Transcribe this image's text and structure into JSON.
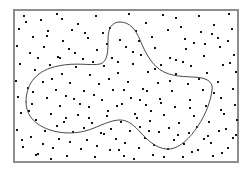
{
  "figure": {
    "title": "",
    "caption": "",
    "background_color": "#ffffff"
  },
  "chart_data": {
    "type": "scatter",
    "title": "",
    "subtitle": "",
    "xlabel": "",
    "ylabel": "",
    "legend": [],
    "legend_position": "none",
    "grid": false,
    "axis_ticks": false,
    "tick_labels": [],
    "annotations": [],
    "xlim": [
      0,
      251
    ],
    "ylim": [
      171,
      0
    ],
    "frame": {
      "name": "plot-frame",
      "x": 14,
      "y": 10,
      "width": 224,
      "height": 152,
      "stroke_color": "#8d8d8d",
      "fill_color": "#ffffff",
      "stroke_width": 1.1
    },
    "point_style": {
      "marker": "square",
      "size": 2.1,
      "color": "#151515"
    },
    "point_count": 206,
    "points": [
      [
        24,
        16
      ],
      [
        41,
        20
      ],
      [
        57,
        14
      ],
      [
        78,
        24
      ],
      [
        96,
        16
      ],
      [
        110,
        28
      ],
      [
        129,
        14
      ],
      [
        146,
        23
      ],
      [
        163,
        15
      ],
      [
        181,
        27
      ],
      [
        199,
        16
      ],
      [
        214,
        25
      ],
      [
        229,
        14
      ],
      [
        19,
        29
      ],
      [
        33,
        37
      ],
      [
        48,
        31
      ],
      [
        63,
        41
      ],
      [
        72,
        30
      ],
      [
        88,
        38
      ],
      [
        103,
        33
      ],
      [
        120,
        40
      ],
      [
        136,
        31
      ],
      [
        152,
        37
      ],
      [
        168,
        30
      ],
      [
        185,
        39
      ],
      [
        201,
        32
      ],
      [
        218,
        38
      ],
      [
        232,
        29
      ],
      [
        17,
        46
      ],
      [
        30,
        53
      ],
      [
        44,
        47
      ],
      [
        58,
        57
      ],
      [
        69,
        49
      ],
      [
        83,
        59
      ],
      [
        97,
        50
      ],
      [
        112,
        58
      ],
      [
        126,
        47
      ],
      [
        141,
        55
      ],
      [
        155,
        48
      ],
      [
        170,
        58
      ],
      [
        186,
        49
      ],
      [
        204,
        56
      ],
      [
        220,
        47
      ],
      [
        234,
        55
      ],
      [
        20,
        64
      ],
      [
        35,
        70
      ],
      [
        50,
        65
      ],
      [
        62,
        74
      ],
      [
        76,
        67
      ],
      [
        90,
        75
      ],
      [
        104,
        66
      ],
      [
        118,
        73
      ],
      [
        133,
        64
      ],
      [
        148,
        72
      ],
      [
        161,
        65
      ],
      [
        176,
        74
      ],
      [
        191,
        66
      ],
      [
        207,
        73
      ],
      [
        223,
        65
      ],
      [
        236,
        72
      ],
      [
        16,
        81
      ],
      [
        28,
        88
      ],
      [
        43,
        82
      ],
      [
        56,
        90
      ],
      [
        70,
        83
      ],
      [
        84,
        91
      ],
      [
        99,
        84
      ],
      [
        113,
        90
      ],
      [
        128,
        82
      ],
      [
        143,
        89
      ],
      [
        158,
        83
      ],
      [
        172,
        91
      ],
      [
        188,
        84
      ],
      [
        203,
        90
      ],
      [
        218,
        82
      ],
      [
        233,
        89
      ],
      [
        18,
        97
      ],
      [
        32,
        104
      ],
      [
        47,
        98
      ],
      [
        60,
        106
      ],
      [
        74,
        99
      ],
      [
        89,
        107
      ],
      [
        102,
        100
      ],
      [
        117,
        106
      ],
      [
        131,
        98
      ],
      [
        146,
        105
      ],
      [
        160,
        99
      ],
      [
        175,
        107
      ],
      [
        190,
        100
      ],
      [
        206,
        106
      ],
      [
        221,
        98
      ],
      [
        235,
        105
      ],
      [
        21,
        113
      ],
      [
        36,
        120
      ],
      [
        51,
        114
      ],
      [
        64,
        122
      ],
      [
        78,
        115
      ],
      [
        92,
        123
      ],
      [
        107,
        116
      ],
      [
        121,
        122
      ],
      [
        135,
        114
      ],
      [
        150,
        121
      ],
      [
        164,
        115
      ],
      [
        179,
        123
      ],
      [
        194,
        116
      ],
      [
        209,
        122
      ],
      [
        224,
        114
      ],
      [
        237,
        120
      ],
      [
        17,
        130
      ],
      [
        31,
        137
      ],
      [
        45,
        131
      ],
      [
        59,
        139
      ],
      [
        73,
        132
      ],
      [
        87,
        140
      ],
      [
        101,
        133
      ],
      [
        116,
        139
      ],
      [
        130,
        131
      ],
      [
        145,
        138
      ],
      [
        159,
        132
      ],
      [
        174,
        140
      ],
      [
        189,
        133
      ],
      [
        204,
        139
      ],
      [
        219,
        131
      ],
      [
        233,
        138
      ],
      [
        23,
        147
      ],
      [
        38,
        154
      ],
      [
        53,
        148
      ],
      [
        67,
        156
      ],
      [
        81,
        149
      ],
      [
        95,
        157
      ],
      [
        110,
        150
      ],
      [
        124,
        156
      ],
      [
        139,
        148
      ],
      [
        153,
        155
      ],
      [
        168,
        149
      ],
      [
        183,
        157
      ],
      [
        198,
        150
      ],
      [
        213,
        156
      ],
      [
        228,
        148
      ],
      [
        26,
        22
      ],
      [
        62,
        19
      ],
      [
        85,
        33
      ],
      [
        107,
        44
      ],
      [
        139,
        41
      ],
      [
        176,
        18
      ],
      [
        194,
        43
      ],
      [
        212,
        34
      ],
      [
        228,
        41
      ],
      [
        38,
        58
      ],
      [
        52,
        79
      ],
      [
        66,
        96
      ],
      [
        93,
        62
      ],
      [
        109,
        79
      ],
      [
        124,
        90
      ],
      [
        140,
        100
      ],
      [
        155,
        69
      ],
      [
        170,
        81
      ],
      [
        183,
        62
      ],
      [
        199,
        79
      ],
      [
        214,
        93
      ],
      [
        230,
        63
      ],
      [
        29,
        111
      ],
      [
        43,
        144
      ],
      [
        57,
        126
      ],
      [
        70,
        142
      ],
      [
        84,
        128
      ],
      [
        97,
        146
      ],
      [
        111,
        129
      ],
      [
        125,
        143
      ],
      [
        140,
        127
      ],
      [
        154,
        145
      ],
      [
        169,
        128
      ],
      [
        184,
        144
      ],
      [
        197,
        127
      ],
      [
        211,
        143
      ],
      [
        226,
        129
      ],
      [
        47,
        36
      ],
      [
        75,
        53
      ],
      [
        118,
        62
      ],
      [
        133,
        52
      ],
      [
        147,
        91
      ],
      [
        161,
        103
      ],
      [
        176,
        60
      ],
      [
        190,
        108
      ],
      [
        205,
        44
      ],
      [
        221,
        110
      ],
      [
        33,
        92
      ],
      [
        60,
        58
      ],
      [
        89,
        118
      ],
      [
        104,
        134
      ],
      [
        119,
        150
      ],
      [
        134,
        159
      ],
      [
        149,
        131
      ],
      [
        164,
        157
      ],
      [
        178,
        135
      ],
      [
        192,
        152
      ],
      [
        208,
        136
      ],
      [
        222,
        153
      ],
      [
        236,
        135
      ],
      [
        22,
        140
      ],
      [
        36,
        155
      ],
      [
        51,
        159
      ],
      [
        66,
        118
      ],
      [
        80,
        104
      ],
      [
        94,
        95
      ],
      [
        108,
        111
      ],
      [
        122,
        104
      ],
      [
        137,
        118
      ],
      [
        151,
        111
      ]
    ],
    "region": {
      "name": "region-boundary-curve",
      "closed": true,
      "stroke_color": "#4a4a4a",
      "stroke_width": 1,
      "fill": "none",
      "description": "closed freeform blob boundary enclosing a subset of the scattered points",
      "path": "M 26 102 C 26 82, 38 70, 58 66 C 76 62, 92 66, 100 64 C 108 62, 108 50, 108 40 C 108 28, 112 22, 120 22 C 130 22, 136 30, 140 40 C 146 54, 152 66, 164 72 C 176 78, 192 76, 202 78 C 210 80, 213 84, 212 90 C 211 100, 206 114, 198 126 C 190 138, 180 148, 170 149 C 160 150, 150 143, 142 134 C 134 125, 128 120, 120 120 C 112 120, 104 124, 94 128 C 82 133, 70 134, 58 132 C 42 129, 26 120, 26 102 Z",
      "extrema": {
        "top": [
          120,
          22
        ],
        "left": [
          26,
          102
        ],
        "right": [
          213,
          88
        ],
        "bottom_left_lobe": [
          58,
          132
        ],
        "bottom_right_lobe": [
          172,
          149
        ],
        "notch": [
          120,
          120
        ]
      }
    }
  }
}
